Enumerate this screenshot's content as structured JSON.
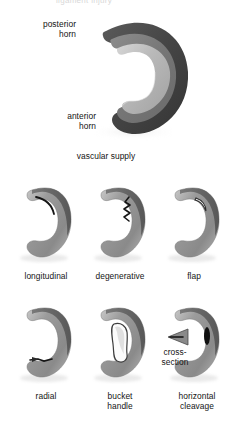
{
  "figure": {
    "title_cut": "ligament injury",
    "background": "#ffffff",
    "ink": "#141414"
  },
  "palette": {
    "outer_dark": "#4d4d4d",
    "outer_dark_edge": "#3a3a3a",
    "mid_gray": "#7e7e7e",
    "inner_light": "#b4b4b4",
    "inner_highlight": "#d2d2d2",
    "tear_black": "#151515",
    "gap_white": "#fdfdfd",
    "shadow": "#9a9a9a"
  },
  "top_panel": {
    "caption": "vascular supply",
    "labels": [
      {
        "id": "posterior-horn",
        "text": "posterior\nhorn"
      },
      {
        "id": "anterior-horn",
        "text": "anterior\nhorn"
      }
    ],
    "zones": [
      {
        "name": "red zone",
        "color": "#4d4d4d"
      },
      {
        "name": "red-white zone",
        "color": "#7e7e7e"
      },
      {
        "name": "white zone",
        "color": "#b4b4b4"
      }
    ]
  },
  "tear_grid": {
    "rows": [
      {
        "row": 1,
        "cells": [
          {
            "id": "longitudinal",
            "caption": "longitudinal",
            "tear": "curved-line-posterior"
          },
          {
            "id": "degenerative",
            "caption": "degenerative",
            "tear": "jagged-zigzag-inner"
          },
          {
            "id": "flap",
            "caption": "flap",
            "tear": "curved-flap-inner"
          }
        ]
      },
      {
        "row": 2,
        "cells": [
          {
            "id": "radial",
            "caption": "radial",
            "tear": "radial-slit-midbody"
          },
          {
            "id": "bucket-handle",
            "caption": "bucket\nhandle",
            "tear": "displaced-fragment"
          },
          {
            "id": "horizontal-cleavage",
            "caption": "horizontal\ncleavage",
            "tear": "horizontal-slit",
            "annotation": "cross-\nsection"
          }
        ]
      }
    ]
  }
}
